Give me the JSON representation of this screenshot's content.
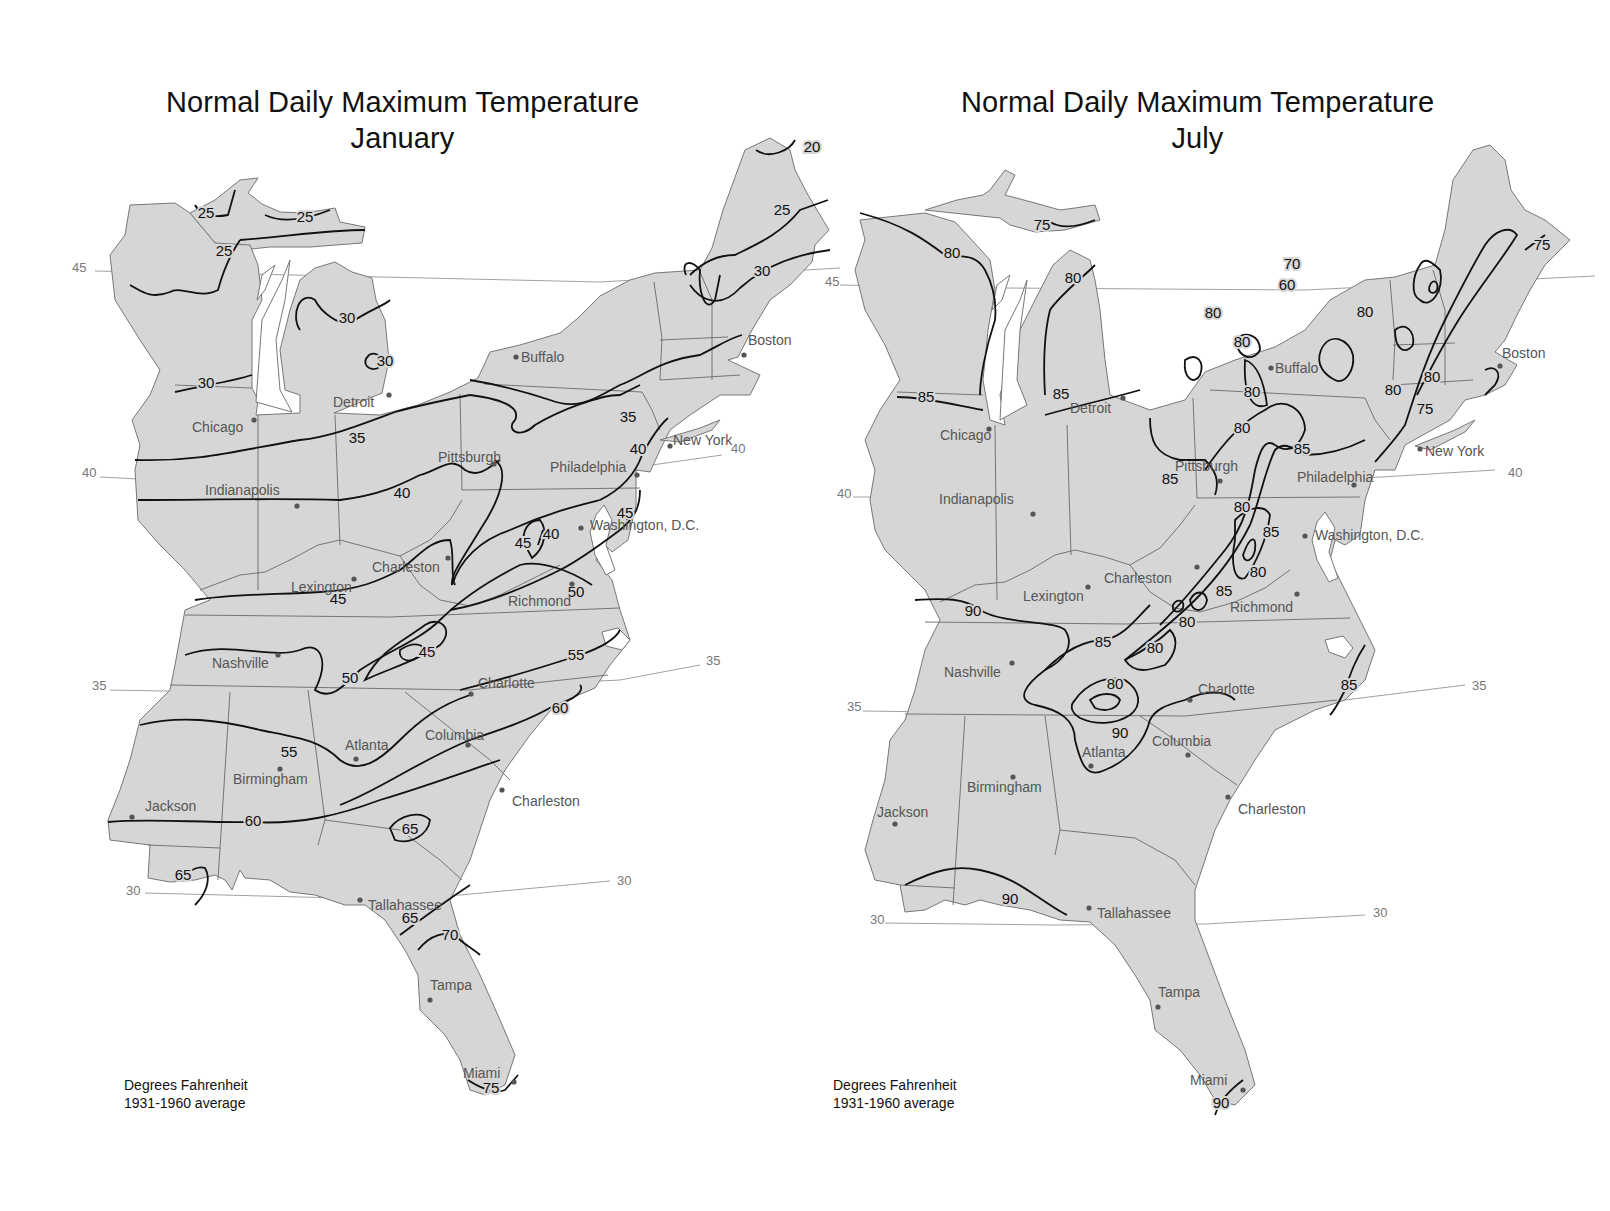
{
  "maps": [
    {
      "id": "january",
      "title_line1": "Normal Daily Maximum Temperature",
      "title_line2": "January",
      "caption_line1": "Degrees Fahrenheit",
      "caption_line2": "1931-1960 average",
      "latitudes": [
        {
          "value": "45",
          "x": 72,
          "y": 272
        },
        {
          "value": "40",
          "x": 82,
          "y": 477
        },
        {
          "value": "35",
          "x": 92,
          "y": 690
        },
        {
          "value": "30",
          "x": 126,
          "y": 895
        },
        {
          "value": "40",
          "x": 731,
          "y": 453
        },
        {
          "value": "35",
          "x": 706,
          "y": 665
        },
        {
          "value": "30",
          "x": 617,
          "y": 885
        }
      ],
      "cities": [
        {
          "name": "Buffalo",
          "x": 516,
          "y": 357,
          "lx": 521,
          "ly": 362
        },
        {
          "name": "Boston",
          "x": 744,
          "y": 355,
          "lx": 748,
          "ly": 345
        },
        {
          "name": "Detroit",
          "x": 389,
          "y": 395,
          "lx": 333,
          "ly": 407
        },
        {
          "name": "Chicago",
          "x": 254,
          "y": 420,
          "lx": 192,
          "ly": 432
        },
        {
          "name": "Pittsburgh",
          "x": 494,
          "y": 464,
          "lx": 438,
          "ly": 462
        },
        {
          "name": "New York",
          "x": 670,
          "y": 446,
          "lx": 673,
          "ly": 445
        },
        {
          "name": "Philadelphia",
          "x": 637,
          "y": 475,
          "lx": 550,
          "ly": 472
        },
        {
          "name": "Indianapolis",
          "x": 297,
          "y": 506,
          "lx": 205,
          "ly": 495
        },
        {
          "name": "Washington, D.C.",
          "x": 581,
          "y": 528,
          "lx": 590,
          "ly": 530
        },
        {
          "name": "Charleston",
          "x": 448,
          "y": 558,
          "lx": 372,
          "ly": 572
        },
        {
          "name": "Lexington",
          "x": 354,
          "y": 579,
          "lx": 291,
          "ly": 592
        },
        {
          "name": "Richmond",
          "x": 572,
          "y": 584,
          "lx": 508,
          "ly": 606
        },
        {
          "name": "Nashville",
          "x": 278,
          "y": 655,
          "lx": 212,
          "ly": 668
        },
        {
          "name": "Charlotte",
          "x": 471,
          "y": 694,
          "lx": 478,
          "ly": 688
        },
        {
          "name": "Atlanta",
          "x": 356,
          "y": 759,
          "lx": 345,
          "ly": 750
        },
        {
          "name": "Columbia",
          "x": 468,
          "y": 745,
          "lx": 425,
          "ly": 740
        },
        {
          "name": "Birmingham",
          "x": 280,
          "y": 769,
          "lx": 233,
          "ly": 784
        },
        {
          "name": "Jackson",
          "x": 132,
          "y": 817,
          "lx": 145,
          "ly": 811
        },
        {
          "name": "Charleston",
          "x": 502,
          "y": 790,
          "lx": 512,
          "ly": 806
        },
        {
          "name": "Tallahassee",
          "x": 360,
          "y": 900,
          "lx": 368,
          "ly": 910
        },
        {
          "name": "Tampa",
          "x": 430,
          "y": 1000,
          "lx": 430,
          "ly": 990
        },
        {
          "name": "Miami",
          "x": 514,
          "y": 1082,
          "lx": 463,
          "ly": 1078
        }
      ],
      "isotherm_labels": [
        {
          "v": "20",
          "x": 812,
          "y": 152
        },
        {
          "v": "25",
          "x": 206,
          "y": 218
        },
        {
          "v": "25",
          "x": 305,
          "y": 222
        },
        {
          "v": "25",
          "x": 224,
          "y": 256
        },
        {
          "v": "25",
          "x": 782,
          "y": 215
        },
        {
          "v": "30",
          "x": 347,
          "y": 323
        },
        {
          "v": "30",
          "x": 385,
          "y": 366
        },
        {
          "v": "30",
          "x": 206,
          "y": 388
        },
        {
          "v": "30",
          "x": 762,
          "y": 276
        },
        {
          "v": "35",
          "x": 357,
          "y": 443
        },
        {
          "v": "35",
          "x": 628,
          "y": 422
        },
        {
          "v": "40",
          "x": 402,
          "y": 498
        },
        {
          "v": "40",
          "x": 638,
          "y": 454
        },
        {
          "v": "40",
          "x": 551,
          "y": 539
        },
        {
          "v": "45",
          "x": 523,
          "y": 548
        },
        {
          "v": "45",
          "x": 625,
          "y": 518
        },
        {
          "v": "45",
          "x": 338,
          "y": 604
        },
        {
          "v": "45",
          "x": 427,
          "y": 657
        },
        {
          "v": "50",
          "x": 576,
          "y": 597
        },
        {
          "v": "50",
          "x": 350,
          "y": 683
        },
        {
          "v": "55",
          "x": 576,
          "y": 660
        },
        {
          "v": "55",
          "x": 289,
          "y": 757
        },
        {
          "v": "60",
          "x": 560,
          "y": 713
        },
        {
          "v": "60",
          "x": 253,
          "y": 826
        },
        {
          "v": "65",
          "x": 410,
          "y": 834
        },
        {
          "v": "65",
          "x": 183,
          "y": 880
        },
        {
          "v": "65",
          "x": 410,
          "y": 923
        },
        {
          "v": "70",
          "x": 450,
          "y": 940
        },
        {
          "v": "75",
          "x": 491,
          "y": 1093
        }
      ]
    },
    {
      "id": "july",
      "title_line1": "Normal Daily Maximum Temperature",
      "title_line2": "July",
      "caption_line1": "Degrees Fahrenheit",
      "caption_line2": "1931-1960 average",
      "latitudes": [
        {
          "value": "45",
          "x": 20,
          "y": 286
        },
        {
          "value": "40",
          "x": 32,
          "y": 498
        },
        {
          "value": "35",
          "x": 42,
          "y": 711
        },
        {
          "value": "30",
          "x": 65,
          "y": 924
        },
        {
          "value": "40",
          "x": 703,
          "y": 477
        },
        {
          "value": "35",
          "x": 667,
          "y": 690
        },
        {
          "value": "30",
          "x": 568,
          "y": 917
        }
      ],
      "cities": [
        {
          "name": "Buffalo",
          "x": 466,
          "y": 368,
          "lx": 470,
          "ly": 373
        },
        {
          "name": "Boston",
          "x": 695,
          "y": 366,
          "lx": 697,
          "ly": 358
        },
        {
          "name": "Detroit",
          "x": 318,
          "y": 398,
          "lx": 265,
          "ly": 413
        },
        {
          "name": "Chicago",
          "x": 184,
          "y": 429,
          "lx": 135,
          "ly": 440
        },
        {
          "name": "Pittsburgh",
          "x": 415,
          "y": 481,
          "lx": 370,
          "ly": 471
        },
        {
          "name": "New York",
          "x": 615,
          "y": 449,
          "lx": 620,
          "ly": 456
        },
        {
          "name": "Philadelphia",
          "x": 549,
          "y": 485,
          "lx": 492,
          "ly": 482
        },
        {
          "name": "Indianapolis",
          "x": 228,
          "y": 514,
          "lx": 134,
          "ly": 504
        },
        {
          "name": "Washington, D.C.",
          "x": 500,
          "y": 536,
          "lx": 510,
          "ly": 540
        },
        {
          "name": "Charleston",
          "x": 392,
          "y": 567,
          "lx": 299,
          "ly": 583
        },
        {
          "name": "Lexington",
          "x": 283,
          "y": 587,
          "lx": 218,
          "ly": 601
        },
        {
          "name": "Richmond",
          "x": 492,
          "y": 594,
          "lx": 425,
          "ly": 612
        },
        {
          "name": "Nashville",
          "x": 207,
          "y": 663,
          "lx": 139,
          "ly": 677
        },
        {
          "name": "Charlotte",
          "x": 385,
          "y": 700,
          "lx": 393,
          "ly": 694
        },
        {
          "name": "Atlanta",
          "x": 286,
          "y": 766,
          "lx": 277,
          "ly": 757
        },
        {
          "name": "Columbia",
          "x": 383,
          "y": 755,
          "lx": 347,
          "ly": 746
        },
        {
          "name": "Birmingham",
          "x": 208,
          "y": 777,
          "lx": 162,
          "ly": 792
        },
        {
          "name": "Jackson",
          "x": 90,
          "y": 824,
          "lx": 72,
          "ly": 817
        },
        {
          "name": "Charleston",
          "x": 423,
          "y": 797,
          "lx": 433,
          "ly": 814
        },
        {
          "name": "Tallahassee",
          "x": 284,
          "y": 908,
          "lx": 292,
          "ly": 918
        },
        {
          "name": "Tampa",
          "x": 353,
          "y": 1007,
          "lx": 353,
          "ly": 997
        },
        {
          "name": "Miami",
          "x": 438,
          "y": 1090,
          "lx": 385,
          "ly": 1085
        }
      ],
      "isotherm_labels": [
        {
          "v": "75",
          "x": 237,
          "y": 230
        },
        {
          "v": "80",
          "x": 147,
          "y": 258
        },
        {
          "v": "80",
          "x": 268,
          "y": 283
        },
        {
          "v": "75",
          "x": 737,
          "y": 250
        },
        {
          "v": "70",
          "x": 487,
          "y": 269
        },
        {
          "v": "60",
          "x": 482,
          "y": 290
        },
        {
          "v": "80",
          "x": 560,
          "y": 317
        },
        {
          "v": "80",
          "x": 408,
          "y": 318
        },
        {
          "v": "80",
          "x": 437,
          "y": 347
        },
        {
          "v": "80",
          "x": 588,
          "y": 395
        },
        {
          "v": "80",
          "x": 447,
          "y": 397
        },
        {
          "v": "80",
          "x": 627,
          "y": 382
        },
        {
          "v": "75",
          "x": 620,
          "y": 414
        },
        {
          "v": "85",
          "x": 121,
          "y": 402
        },
        {
          "v": "85",
          "x": 256,
          "y": 399
        },
        {
          "v": "85",
          "x": 365,
          "y": 484
        },
        {
          "v": "80",
          "x": 437,
          "y": 433
        },
        {
          "v": "85",
          "x": 497,
          "y": 454
        },
        {
          "v": "80",
          "x": 437,
          "y": 512
        },
        {
          "v": "85",
          "x": 466,
          "y": 537
        },
        {
          "v": "80",
          "x": 453,
          "y": 577
        },
        {
          "v": "85",
          "x": 419,
          "y": 596
        },
        {
          "v": "80",
          "x": 382,
          "y": 627
        },
        {
          "v": "90",
          "x": 168,
          "y": 616
        },
        {
          "v": "85",
          "x": 298,
          "y": 647
        },
        {
          "v": "80",
          "x": 350,
          "y": 653
        },
        {
          "v": "80",
          "x": 310,
          "y": 689
        },
        {
          "v": "90",
          "x": 315,
          "y": 738
        },
        {
          "v": "85",
          "x": 544,
          "y": 690
        },
        {
          "v": "90",
          "x": 205,
          "y": 904
        },
        {
          "v": "90",
          "x": 416,
          "y": 1108
        }
      ]
    }
  ]
}
